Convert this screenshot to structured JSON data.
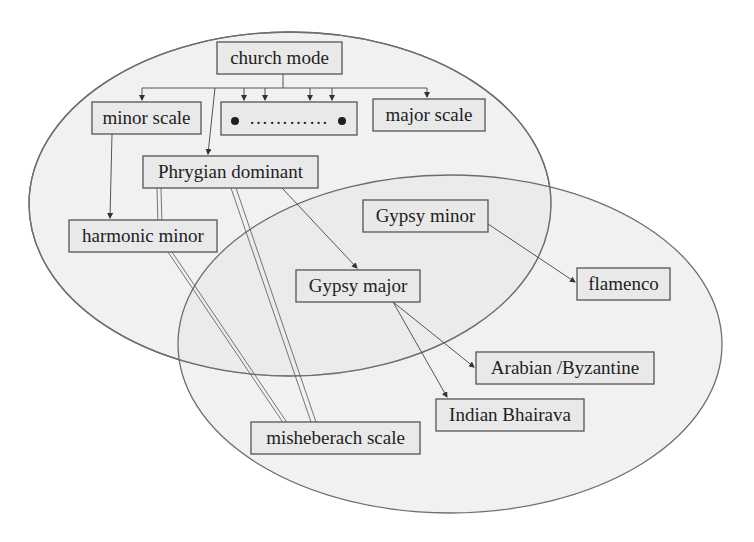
{
  "diagram": {
    "colors": {
      "background": "#ffffff",
      "region_fill": "#e6e6e6",
      "region_stroke": "#6e6e6e",
      "box_fill": "#e9e9e9",
      "box_stroke": "#555555",
      "text": "#1e1e1e"
    },
    "regions": [
      {
        "id": "upper-region",
        "cx": 290,
        "cy": 204,
        "rx": 261,
        "ry": 172
      },
      {
        "id": "lower-region",
        "cx": 450,
        "cy": 344,
        "rx": 272,
        "ry": 169
      }
    ],
    "nodes": {
      "church_mode": {
        "label": "church mode"
      },
      "minor_scale": {
        "label": "minor scale"
      },
      "other_modes": {
        "label": "● ………… ●"
      },
      "major_scale": {
        "label": "major scale"
      },
      "phrygian_dominant": {
        "label": "Phrygian dominant"
      },
      "harmonic_minor": {
        "label": "harmonic minor"
      },
      "gypsy_minor": {
        "label": "Gypsy minor"
      },
      "gypsy_major": {
        "label": "Gypsy major"
      },
      "flamenco": {
        "label": "flamenco"
      },
      "arabian_byzantine": {
        "label": "Arabian /Byzantine"
      },
      "indian_bhairava": {
        "label": "Indian Bhairava"
      },
      "misheberach_scale": {
        "label": "misheberach scale"
      }
    },
    "edges": [
      {
        "from": "church_mode",
        "to": "minor_scale",
        "type": "arrow"
      },
      {
        "from": "church_mode",
        "to": "other_modes",
        "type": "arrow",
        "count": 4
      },
      {
        "from": "church_mode",
        "to": "major_scale",
        "type": "arrow"
      },
      {
        "from": "church_mode",
        "to": "phrygian_dominant",
        "type": "arrow"
      },
      {
        "from": "minor_scale",
        "to": "harmonic_minor",
        "type": "arrow"
      },
      {
        "from": "phrygian_dominant",
        "to": "gypsy_major",
        "type": "arrow"
      },
      {
        "from": "gypsy_minor",
        "to": "flamenco",
        "type": "arrow"
      },
      {
        "from": "gypsy_major",
        "to": "arabian_byzantine",
        "type": "arrow"
      },
      {
        "from": "gypsy_major",
        "to": "indian_bhairava",
        "type": "arrow"
      },
      {
        "from": "phrygian_dominant",
        "to": "misheberach_scale",
        "type": "double-line",
        "count": 2
      },
      {
        "from": "harmonic_minor",
        "to": "misheberach_scale",
        "type": "double-line"
      }
    ]
  }
}
